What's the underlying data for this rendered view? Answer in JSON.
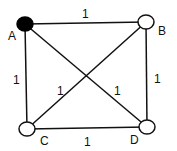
{
  "diagram": {
    "type": "graph",
    "nodes": [
      {
        "id": "A",
        "label": "A",
        "x": 25,
        "y": 24,
        "filled": true
      },
      {
        "id": "B",
        "label": "B",
        "x": 146,
        "y": 22,
        "filled": false
      },
      {
        "id": "C",
        "label": "C",
        "x": 27,
        "y": 129,
        "filled": false
      },
      {
        "id": "D",
        "label": "D",
        "x": 147,
        "y": 127,
        "filled": false
      }
    ],
    "edges": [
      {
        "from": "A",
        "to": "B",
        "weight": "1"
      },
      {
        "from": "A",
        "to": "C",
        "weight": "1"
      },
      {
        "from": "B",
        "to": "D",
        "weight": "1"
      },
      {
        "from": "C",
        "to": "D",
        "weight": "1"
      },
      {
        "from": "A",
        "to": "D",
        "weight": "1"
      },
      {
        "from": "B",
        "to": "C",
        "weight": "1"
      }
    ],
    "colors": {
      "stroke": "#111111",
      "filled_node": "#000000",
      "empty_node": "#ffffff"
    }
  }
}
